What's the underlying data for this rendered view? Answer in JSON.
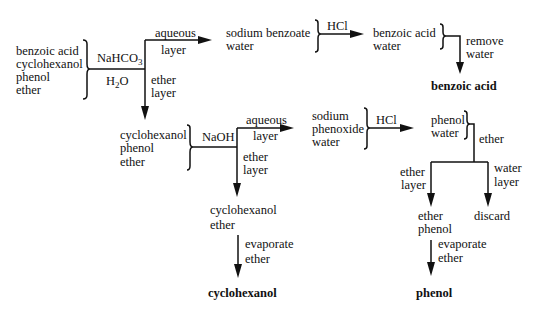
{
  "diagram": {
    "start_mixture": [
      "benzoic acid",
      "cyclohexanol",
      "phenol",
      "ether"
    ],
    "step1": {
      "reagent": "NaHCO3",
      "reagent_base": "NaHCO",
      "reagent_sub": "3",
      "reagent2_base": "H",
      "reagent2_sub": "2",
      "reagent2_tail": "O",
      "aqueous_label": [
        "aqueous",
        "layer"
      ],
      "ether_label": [
        "ether",
        "layer"
      ]
    },
    "aqueous1": [
      "sodium benzoate",
      "water"
    ],
    "acidify1": {
      "reagent": "HCl"
    },
    "acidified1": [
      "benzoic acid",
      "water"
    ],
    "remove_water_label": [
      "remove",
      "water"
    ],
    "product1": "benzoic acid",
    "ether1": [
      "cyclohexanol",
      "phenol",
      "ether"
    ],
    "step2": {
      "reagent": "NaOH",
      "aqueous_label": [
        "aqueous",
        "layer"
      ],
      "ether_label": [
        "ether",
        "layer"
      ]
    },
    "aqueous2": [
      "sodium",
      "phenoxide",
      "water"
    ],
    "acidify2": {
      "reagent": "HCl"
    },
    "acidified2": [
      "phenol",
      "water"
    ],
    "extract_label": "ether",
    "split_labels": {
      "left": [
        "ether",
        "layer"
      ],
      "right": [
        "water",
        "layer"
      ]
    },
    "ether_phase": [
      "ether",
      "phenol"
    ],
    "discard": "discard",
    "evaporate_label": [
      "evaporate",
      "ether"
    ],
    "product3": "phenol",
    "ether2": [
      "cyclohexanol",
      "ether"
    ],
    "evaporate_label2": [
      "evaporate",
      "ether"
    ],
    "product2": "cyclohexanol"
  }
}
